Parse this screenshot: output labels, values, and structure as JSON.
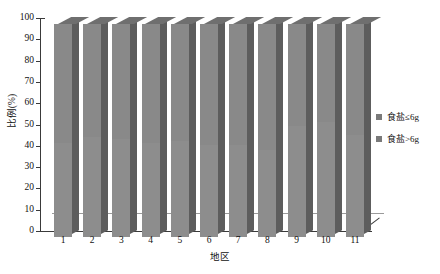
{
  "chart_data": {
    "type": "bar",
    "title": "",
    "subtitle": "",
    "xlabel": "地区",
    "ylabel": "比例(%)",
    "categories": [
      "1",
      "2",
      "3",
      "4",
      "5",
      "6",
      "7",
      "8",
      "9",
      "10",
      "11"
    ],
    "yticks": [
      "0",
      "10",
      "20",
      "30",
      "40",
      "50",
      "60",
      "70",
      "80",
      "90",
      "100"
    ],
    "ylim": [
      0,
      100
    ],
    "grid": false,
    "stacked": true,
    "legend_position": "right",
    "style": "3d-column",
    "series": [
      {
        "name": "食盐≤6g",
        "color": "#8d8d8d",
        "values": [
          44,
          47,
          46,
          44,
          45,
          43,
          43,
          41,
          52,
          54,
          48
        ]
      },
      {
        "name": "食盐>6g",
        "color": "#898989",
        "values": [
          56,
          53,
          54,
          56,
          55,
          57,
          57,
          59,
          48,
          46,
          52
        ]
      }
    ]
  },
  "legend": {
    "items": [
      {
        "label": "食盐≤6g",
        "color": "#7a7a7a"
      },
      {
        "label": "食盐>6g",
        "color": "#7a7a7a"
      }
    ]
  },
  "axes": {
    "y_title": "比例(%)",
    "x_title": "地区"
  }
}
